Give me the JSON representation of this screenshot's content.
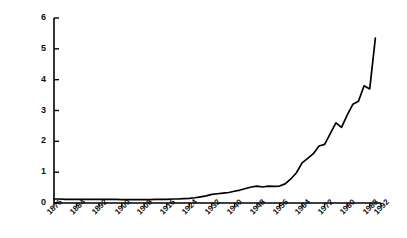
{
  "chart_data": {
    "type": "line",
    "title": "",
    "subtitle": "",
    "xlabel": "",
    "ylabel": "Total crimes in millions",
    "xlim": [
      1876,
      1992
    ],
    "ylim": [
      0,
      6
    ],
    "grid": false,
    "legend": null,
    "legend_position": "none",
    "line_color": "#000000",
    "axis_color": "#000000",
    "background_color": "#ffffff",
    "yticks": [
      "0",
      "1",
      "2",
      "3",
      "4",
      "5",
      "6"
    ],
    "ytick_values": [
      0,
      1,
      2,
      3,
      4,
      5,
      6
    ],
    "xticks": [
      "1876",
      "1884",
      "1892",
      "1900",
      "1908",
      "1916",
      "1924",
      "1932",
      "1940",
      "1948",
      "1956",
      "1964",
      "1972",
      "1980",
      "1988",
      "1992"
    ],
    "xtick_values": [
      1876,
      1884,
      1892,
      1900,
      1908,
      1916,
      1924,
      1932,
      1940,
      1948,
      1956,
      1964,
      1972,
      1980,
      1988,
      1992
    ],
    "x": [
      1876,
      1878,
      1880,
      1882,
      1884,
      1886,
      1888,
      1890,
      1892,
      1894,
      1896,
      1898,
      1900,
      1902,
      1904,
      1906,
      1908,
      1910,
      1912,
      1914,
      1916,
      1918,
      1920,
      1922,
      1924,
      1926,
      1928,
      1930,
      1932,
      1934,
      1936,
      1938,
      1940,
      1942,
      1944,
      1946,
      1948,
      1950,
      1952,
      1954,
      1956,
      1958,
      1960,
      1962,
      1964,
      1966,
      1968,
      1970,
      1972,
      1974,
      1976,
      1978,
      1980,
      1982,
      1984,
      1986,
      1988,
      1990
    ],
    "values": [
      0.13,
      0.13,
      0.12,
      0.12,
      0.12,
      0.12,
      0.12,
      0.12,
      0.12,
      0.12,
      0.12,
      0.12,
      0.11,
      0.11,
      0.11,
      0.11,
      0.11,
      0.11,
      0.12,
      0.12,
      0.12,
      0.13,
      0.13,
      0.14,
      0.15,
      0.17,
      0.2,
      0.23,
      0.28,
      0.3,
      0.32,
      0.34,
      0.38,
      0.42,
      0.47,
      0.52,
      0.55,
      0.52,
      0.55,
      0.54,
      0.55,
      0.62,
      0.78,
      0.98,
      1.3,
      1.45,
      1.6,
      1.85,
      1.9,
      2.25,
      2.6,
      2.45,
      2.85,
      3.2,
      3.3,
      3.8,
      3.7,
      5.35
    ],
    "series": [
      {
        "name": "Total crimes",
        "values": [
          0.13,
          0.13,
          0.12,
          0.12,
          0.12,
          0.12,
          0.12,
          0.12,
          0.12,
          0.12,
          0.12,
          0.12,
          0.11,
          0.11,
          0.11,
          0.11,
          0.11,
          0.11,
          0.12,
          0.12,
          0.12,
          0.13,
          0.13,
          0.14,
          0.15,
          0.17,
          0.2,
          0.23,
          0.28,
          0.3,
          0.32,
          0.34,
          0.38,
          0.42,
          0.47,
          0.52,
          0.55,
          0.52,
          0.55,
          0.54,
          0.55,
          0.62,
          0.78,
          0.98,
          1.3,
          1.45,
          1.6,
          1.85,
          1.9,
          2.25,
          2.6,
          2.45,
          2.85,
          3.2,
          3.3,
          3.8,
          3.7,
          5.35
        ]
      }
    ],
    "annotations": []
  }
}
